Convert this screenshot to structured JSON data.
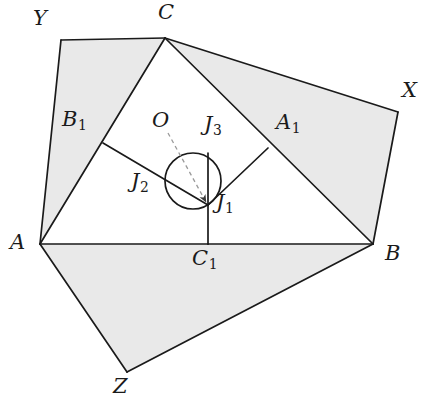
{
  "figure": {
    "background_color": "#ffffff",
    "shade_color": "#e9e9e9",
    "stroke_color": "#1a1a1a",
    "dash_color": "#9a9a9a"
  },
  "points": {
    "A": {
      "label": "A",
      "x": 40,
      "y": 244,
      "label_x": 10,
      "label_y": 232
    },
    "B": {
      "label": "B",
      "x": 373,
      "y": 244,
      "label_x": 385,
      "label_y": 243
    },
    "C": {
      "label": "C",
      "x": 165,
      "y": 38,
      "label_x": 158,
      "label_y": 2
    },
    "A1": {
      "label": "A",
      "sub": "1",
      "x": 268,
      "y": 148,
      "label_x": 276,
      "label_y": 112
    },
    "B1": {
      "label": "B",
      "sub": "1",
      "x": 103,
      "y": 143,
      "label_x": 62,
      "label_y": 109
    },
    "C1": {
      "label": "C",
      "sub": "1",
      "x": 208,
      "y": 244,
      "label_x": 192,
      "label_y": 248
    },
    "J1": {
      "label": "J",
      "sub": "1",
      "x": 208,
      "y": 205,
      "label_x": 216,
      "label_y": 192
    },
    "J2": {
      "label": "J",
      "sub": "2",
      "x": 166,
      "y": 176,
      "label_x": 131,
      "label_y": 171
    },
    "J3": {
      "label": "J",
      "sub": "3",
      "x": 208,
      "y": 153,
      "label_x": 204,
      "label_y": 114
    },
    "O": {
      "label": "O",
      "x": 193,
      "y": 181,
      "label_x": 152,
      "label_y": 110
    },
    "X": {
      "label": "X",
      "x": 398,
      "y": 112,
      "label_x": 402,
      "label_y": 80
    },
    "Y": {
      "label": "Y",
      "x": 61,
      "y": 40,
      "label_x": 33,
      "label_y": 8
    },
    "Z": {
      "label": "Z",
      "x": 127,
      "y": 372,
      "label_x": 113,
      "label_y": 376
    }
  },
  "circle": {
    "name": "incircle",
    "center_x": 193,
    "center_y": 181,
    "radius": 28
  },
  "shaded_regions": [
    {
      "name": "region-ACY",
      "polygon": "40,244 165,38 61,40"
    },
    {
      "name": "region-BCX",
      "polygon": "165,38 373,244 398,112"
    },
    {
      "name": "region-ABZ",
      "polygon": "40,244 373,244 127,372"
    }
  ],
  "triangle": {
    "name": "triangle-ABC",
    "polygon": "40,244 373,244 165,38"
  },
  "segments": [
    {
      "name": "segment-A-C1",
      "x1": 40,
      "y1": 244,
      "x2": 208,
      "y2": 244
    },
    {
      "name": "segment-C1-B",
      "x1": 208,
      "y1": 244,
      "x2": 373,
      "y2": 244
    },
    {
      "name": "segment-A-C",
      "x1": 40,
      "y1": 244,
      "x2": 165,
      "y2": 38
    },
    {
      "name": "segment-C-B",
      "x1": 165,
      "y1": 38,
      "x2": 373,
      "y2": 244
    },
    {
      "name": "segment-C1-J3",
      "x1": 208,
      "y1": 244,
      "x2": 208,
      "y2": 153
    },
    {
      "name": "segment-B1-J1",
      "x1": 103,
      "y1": 143,
      "x2": 208,
      "y2": 205
    },
    {
      "name": "segment-A1-J1",
      "x1": 268,
      "y1": 148,
      "x2": 208,
      "y2": 205
    },
    {
      "name": "segment-A-Y",
      "x1": 40,
      "y1": 244,
      "x2": 61,
      "y2": 40
    },
    {
      "name": "segment-Y-C",
      "x1": 61,
      "y1": 40,
      "x2": 165,
      "y2": 38
    },
    {
      "name": "segment-C-X",
      "x1": 165,
      "y1": 38,
      "x2": 398,
      "y2": 112
    },
    {
      "name": "segment-X-B",
      "x1": 398,
      "y1": 112,
      "x2": 373,
      "y2": 244
    },
    {
      "name": "segment-A-Z",
      "x1": 40,
      "y1": 244,
      "x2": 127,
      "y2": 372
    },
    {
      "name": "segment-Z-B",
      "x1": 127,
      "y1": 372,
      "x2": 373,
      "y2": 244
    }
  ],
  "dashed_arrow": {
    "name": "pointer-O-to-J1",
    "x1": 168,
    "y1": 133,
    "x2": 206,
    "y2": 202
  }
}
